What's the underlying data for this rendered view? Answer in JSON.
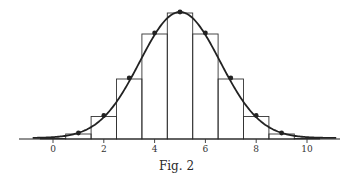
{
  "caption": "Fig. 2",
  "colors": {
    "ink": "#222222",
    "background": "#ffffff"
  },
  "chart_data": {
    "type": "bar",
    "title": "",
    "caption": "Fig. 2",
    "xlabel": "",
    "ylabel": "",
    "categories": [
      0,
      1,
      2,
      3,
      4,
      5,
      6,
      7,
      8,
      9,
      10
    ],
    "values": [
      1,
      10,
      45,
      120,
      210,
      252,
      210,
      120,
      45,
      10,
      1
    ],
    "points": [
      1,
      10,
      45,
      120,
      210,
      252,
      210,
      120,
      45,
      10,
      1
    ],
    "overlay_curve": "normal density fit (mean 5, sd ~1.58)",
    "xticks": [
      0,
      2,
      4,
      6,
      8,
      10
    ],
    "xlim": [
      -0.9,
      11.3
    ],
    "ylim": [
      0,
      252
    ],
    "grid": false,
    "legend": null
  }
}
